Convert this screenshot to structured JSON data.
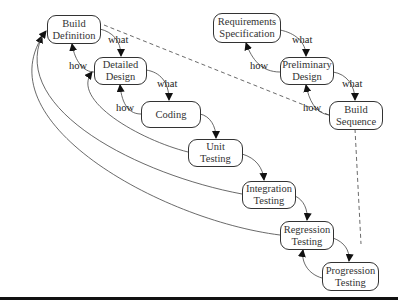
{
  "nodes": {
    "build_definition": {
      "line1": "Build",
      "line2": "Definition"
    },
    "detailed_design": {
      "line1": "Detailed",
      "line2": "Design"
    },
    "coding": {
      "line1": "Coding"
    },
    "unit_testing": {
      "line1": "Unit",
      "line2": "Testing"
    },
    "integration_testing": {
      "line1": "Integration",
      "line2": "Testing"
    },
    "regression_testing": {
      "line1": "Regression",
      "line2": "Testing"
    },
    "progression_testing": {
      "line1": "Progression",
      "line2": "Testing"
    },
    "requirements_specification": {
      "line1": "Requirements",
      "line2": "Specification"
    },
    "preliminary_design": {
      "line1": "Preliminary",
      "line2": "Design"
    },
    "build_sequence": {
      "line1": "Build",
      "line2": "Sequence"
    }
  },
  "edge_labels": {
    "what": "what",
    "how": "how"
  }
}
